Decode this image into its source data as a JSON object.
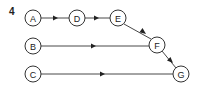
{
  "figure": {
    "label": "4",
    "nodes": [
      {
        "id": "A",
        "label": "A",
        "x": 33,
        "y": 18
      },
      {
        "id": "D",
        "label": "D",
        "x": 77,
        "y": 18
      },
      {
        "id": "E",
        "label": "E",
        "x": 118,
        "y": 18
      },
      {
        "id": "B",
        "label": "B",
        "x": 33,
        "y": 46
      },
      {
        "id": "F",
        "label": "F",
        "x": 157,
        "y": 45
      },
      {
        "id": "C",
        "label": "C",
        "x": 33,
        "y": 74
      },
      {
        "id": "G",
        "label": "G",
        "x": 181,
        "y": 74
      }
    ],
    "edges": [
      {
        "from": "A",
        "to": "D"
      },
      {
        "from": "D",
        "to": "E"
      },
      {
        "from": "E",
        "to": "F"
      },
      {
        "from": "B",
        "to": "F"
      },
      {
        "from": "F",
        "to": "G"
      },
      {
        "from": "C",
        "to": "G"
      }
    ]
  }
}
